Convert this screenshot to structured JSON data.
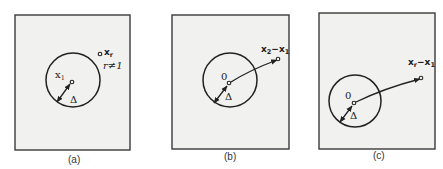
{
  "figure": {
    "panels": [
      {
        "id": "a",
        "caption": "(a)",
        "center_label_main": "x",
        "center_label_sub": "1",
        "radius_label": "Δ",
        "point_label_main": "x",
        "point_label_sub": "r",
        "point_condition": "r≠1"
      },
      {
        "id": "b",
        "caption": "(b)",
        "center_label": "0",
        "radius_label": "Δ",
        "vector_label_a_main": "x",
        "vector_label_a_sub": "2",
        "vector_label_op": "−",
        "vector_label_b_main": "x",
        "vector_label_b_sub": "1"
      },
      {
        "id": "c",
        "caption": "(c)",
        "center_label": "0",
        "radius_label": "Δ",
        "vector_label_a_main": "x",
        "vector_label_a_sub": "r",
        "vector_label_op": "−",
        "vector_label_b_main": "x",
        "vector_label_b_sub": "1"
      }
    ],
    "colors": {
      "panel_fill": "#f1f1ef",
      "stroke": "#222222",
      "background": "#ffffff"
    }
  }
}
